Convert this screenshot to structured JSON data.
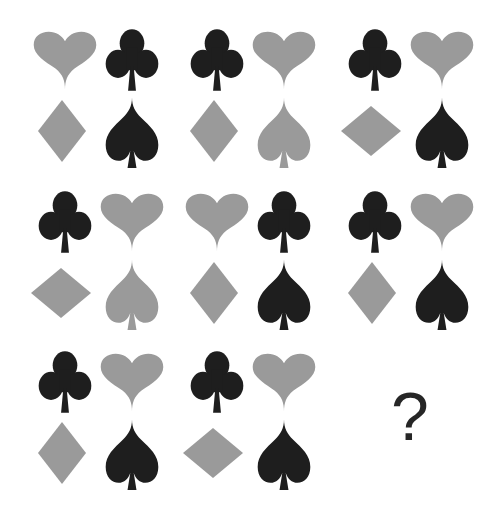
{
  "puzzle": {
    "colors": {
      "gray": "#9a9a9a",
      "black": "#1e1e1e"
    },
    "cells": [
      {
        "tl": {
          "suit": "heart",
          "color": "gray"
        },
        "tr": {
          "suit": "club",
          "color": "black"
        },
        "bl": {
          "suit": "diamond",
          "color": "gray",
          "orientation": "tall"
        },
        "br": {
          "suit": "spade",
          "color": "black"
        }
      },
      {
        "tl": {
          "suit": "club",
          "color": "black"
        },
        "tr": {
          "suit": "heart",
          "color": "gray"
        },
        "bl": {
          "suit": "diamond",
          "color": "gray",
          "orientation": "tall"
        },
        "br": {
          "suit": "spade",
          "color": "gray"
        }
      },
      {
        "tl": {
          "suit": "club",
          "color": "black"
        },
        "tr": {
          "suit": "heart",
          "color": "gray"
        },
        "bl": {
          "suit": "diamond",
          "color": "gray",
          "orientation": "wide"
        },
        "br": {
          "suit": "spade",
          "color": "black"
        }
      },
      {
        "tl": {
          "suit": "club",
          "color": "black"
        },
        "tr": {
          "suit": "heart",
          "color": "gray"
        },
        "bl": {
          "suit": "diamond",
          "color": "gray",
          "orientation": "wide"
        },
        "br": {
          "suit": "spade",
          "color": "gray"
        }
      },
      {
        "tl": {
          "suit": "heart",
          "color": "gray"
        },
        "tr": {
          "suit": "club",
          "color": "black"
        },
        "bl": {
          "suit": "diamond",
          "color": "gray",
          "orientation": "tall"
        },
        "br": {
          "suit": "spade",
          "color": "black"
        }
      },
      {
        "tl": {
          "suit": "club",
          "color": "black"
        },
        "tr": {
          "suit": "heart",
          "color": "gray"
        },
        "bl": {
          "suit": "diamond",
          "color": "gray",
          "orientation": "tall"
        },
        "br": {
          "suit": "spade",
          "color": "black"
        }
      },
      {
        "tl": {
          "suit": "club",
          "color": "black"
        },
        "tr": {
          "suit": "heart",
          "color": "gray"
        },
        "bl": {
          "suit": "diamond",
          "color": "gray",
          "orientation": "tall"
        },
        "br": {
          "suit": "spade",
          "color": "black"
        }
      },
      {
        "tl": {
          "suit": "club",
          "color": "black"
        },
        "tr": {
          "suit": "heart",
          "color": "gray"
        },
        "bl": {
          "suit": "diamond",
          "color": "gray",
          "orientation": "wide"
        },
        "br": {
          "suit": "spade",
          "color": "black"
        }
      }
    ],
    "missing_cell": {
      "label": "?"
    }
  }
}
